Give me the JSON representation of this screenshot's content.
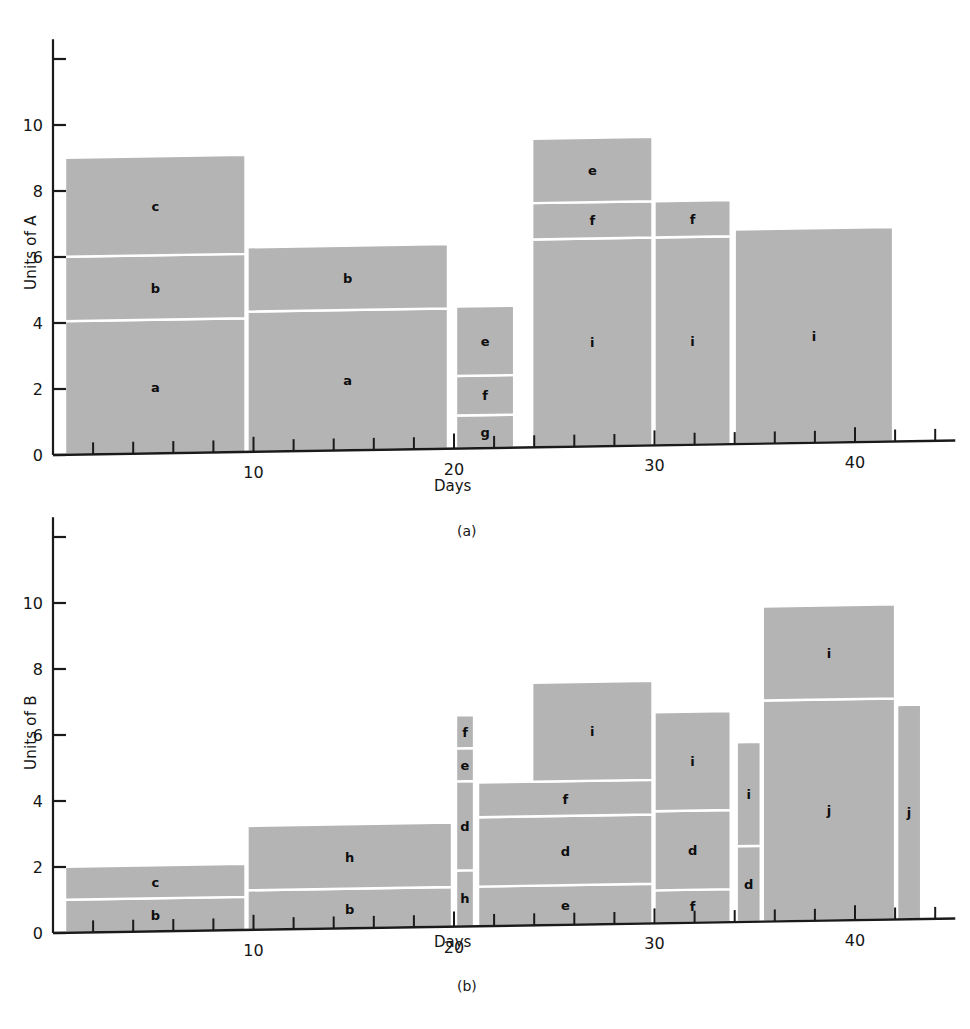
{
  "figure": {
    "background_color": "#ffffff",
    "bar_fill_color": "#b4b4b4",
    "bar_edge_color": "#ffffff",
    "axis_color": "#1a1a1a",
    "text_color": "#151515"
  },
  "panels": [
    {
      "id": "a",
      "caption": "(a)",
      "ylabel": "Units of A",
      "xlabel": "Days",
      "yticks_major": [
        0,
        2,
        4,
        6,
        8,
        10
      ],
      "ytick_labels": [
        "0",
        "2",
        "4",
        "6",
        "8",
        "10"
      ],
      "ytick_extra_unlabeled": [
        12
      ],
      "xticks_major": [
        10,
        20,
        30,
        40
      ],
      "xtick_labels": [
        "10",
        "20",
        "30",
        "40"
      ],
      "xtick_minor_step": 2,
      "xlim": [
        0,
        45
      ],
      "ylim": [
        0,
        12.6
      ]
    },
    {
      "id": "b",
      "caption": "(b)",
      "ylabel": "Units of B",
      "xlabel": "Days",
      "yticks_major": [
        0,
        2,
        4,
        6,
        8,
        10
      ],
      "ytick_labels": [
        "0",
        "2",
        "4",
        "6",
        "8",
        "10"
      ],
      "ytick_extra_unlabeled": [
        12
      ],
      "xticks_major": [
        10,
        20,
        30,
        40
      ],
      "xtick_labels": [
        "10",
        "20",
        "30",
        "40"
      ],
      "xtick_minor_step": 2,
      "xlim": [
        0,
        45
      ],
      "ylim": [
        0,
        12.6
      ]
    }
  ],
  "chart_data": [
    {
      "type": "bar",
      "panel": "a",
      "title": "",
      "subtitle": "(a)",
      "xlabel": "Days",
      "ylabel": "Units of A",
      "xlim": [
        0,
        45
      ],
      "ylim": [
        0,
        12.6
      ],
      "grid": false,
      "legend": "none",
      "orientation": "stacked-variable-width",
      "description": "Stacked bars of variable width; each column spans a day interval and is divided into labelled resource segments.",
      "columns": [
        {
          "x_start": 0.6,
          "x_end": 9.6,
          "segments": [
            {
              "label": "a",
              "y_start": 0.0,
              "y_end": 4.05
            },
            {
              "label": "b",
              "y_start": 4.05,
              "y_end": 6.0
            },
            {
              "label": "c",
              "y_start": 6.0,
              "y_end": 9.0
            }
          ]
        },
        {
          "x_start": 9.7,
          "x_end": 19.7,
          "segments": [
            {
              "label": "a",
              "y_start": 0.0,
              "y_end": 4.25
            },
            {
              "label": "b",
              "y_start": 4.25,
              "y_end": 6.2
            }
          ]
        },
        {
          "x_start": 20.1,
          "x_end": 23.0,
          "segments": [
            {
              "label": "g",
              "y_start": 0.0,
              "y_end": 1.0
            },
            {
              "label": "f",
              "y_start": 1.0,
              "y_end": 2.2
            },
            {
              "label": "e",
              "y_start": 2.2,
              "y_end": 4.3
            }
          ]
        },
        {
          "x_start": 23.9,
          "x_end": 29.9,
          "segments": [
            {
              "label": "i",
              "y_start": 0.0,
              "y_end": 6.3
            },
            {
              "label": "f",
              "y_start": 6.3,
              "y_end": 7.4
            },
            {
              "label": "e",
              "y_start": 7.4,
              "y_end": 9.35
            }
          ]
        },
        {
          "x_start": 30.0,
          "x_end": 33.8,
          "segments": [
            {
              "label": "i",
              "y_start": 0.0,
              "y_end": 6.3
            },
            {
              "label": "f",
              "y_start": 6.3,
              "y_end": 7.4
            }
          ]
        },
        {
          "x_start": 34.0,
          "x_end": 41.9,
          "segments": [
            {
              "label": "i",
              "y_start": 0.0,
              "y_end": 6.5
            }
          ]
        }
      ]
    },
    {
      "type": "bar",
      "panel": "b",
      "title": "",
      "subtitle": "(b)",
      "xlabel": "Days",
      "ylabel": "Units of B",
      "xlim": [
        0,
        45
      ],
      "ylim": [
        0,
        12.6
      ],
      "grid": false,
      "legend": "none",
      "orientation": "stacked-variable-width",
      "description": "Stacked bars of variable width; each column spans a day interval and is divided into labelled resource segments.",
      "columns": [
        {
          "x_start": 0.6,
          "x_end": 9.6,
          "segments": [
            {
              "label": "b",
              "y_start": 0.0,
              "y_end": 1.0
            },
            {
              "label": "c",
              "y_start": 1.0,
              "y_end": 2.0
            }
          ]
        },
        {
          "x_start": 9.7,
          "x_end": 19.9,
          "segments": [
            {
              "label": "b",
              "y_start": 0.0,
              "y_end": 1.2
            },
            {
              "label": "h",
              "y_start": 1.2,
              "y_end": 3.15
            }
          ]
        },
        {
          "x_start": 20.1,
          "x_end": 21.0,
          "segments": [
            {
              "label": "h",
              "y_start": 0.0,
              "y_end": 1.7
            },
            {
              "label": "d",
              "y_start": 1.7,
              "y_end": 4.4
            },
            {
              "label": "e",
              "y_start": 4.4,
              "y_end": 5.4
            },
            {
              "label": "f",
              "y_start": 5.4,
              "y_end": 6.4
            }
          ]
        },
        {
          "x_start": 21.2,
          "x_end": 29.9,
          "segments": [
            {
              "label": "e",
              "y_start": 0.0,
              "y_end": 1.2
            },
            {
              "label": "d",
              "y_start": 1.2,
              "y_end": 3.3
            },
            {
              "label": "f",
              "y_start": 3.3,
              "y_end": 4.35
            }
          ]
        },
        {
          "x_start": 23.9,
          "x_end": 29.9,
          "segments": [
            {
              "label": "i",
              "y_start": 4.35,
              "y_end": 7.35
            }
          ]
        },
        {
          "x_start": 30.0,
          "x_end": 33.8,
          "segments": [
            {
              "label": "f",
              "y_start": 0.0,
              "y_end": 1.0
            },
            {
              "label": "d",
              "y_start": 1.0,
              "y_end": 3.4
            },
            {
              "label": "i",
              "y_start": 3.4,
              "y_end": 6.4
            }
          ]
        },
        {
          "x_start": 34.1,
          "x_end": 35.3,
          "segments": [
            {
              "label": "d",
              "y_start": 0.0,
              "y_end": 2.3
            },
            {
              "label": "i",
              "y_start": 2.3,
              "y_end": 5.45
            }
          ]
        },
        {
          "x_start": 35.4,
          "x_end": 42.0,
          "segments": [
            {
              "label": "j",
              "y_start": 0.0,
              "y_end": 6.7
            },
            {
              "label": "i",
              "y_start": 6.7,
              "y_end": 9.55
            }
          ]
        },
        {
          "x_start": 42.1,
          "x_end": 43.3,
          "segments": [
            {
              "label": "j",
              "y_start": 0.0,
              "y_end": 6.5
            }
          ]
        }
      ]
    }
  ]
}
